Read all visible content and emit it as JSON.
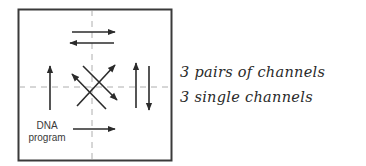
{
  "diagram": {
    "box_label": {
      "line1": "DNA",
      "line2": "program"
    },
    "legend": [
      {
        "text": "3 pairs of channels"
      },
      {
        "text": "3 single channels"
      }
    ],
    "colors": {
      "stroke": "#2b2b2b",
      "dashed": "#9a9a9a",
      "border": "#3a3a3a"
    }
  }
}
